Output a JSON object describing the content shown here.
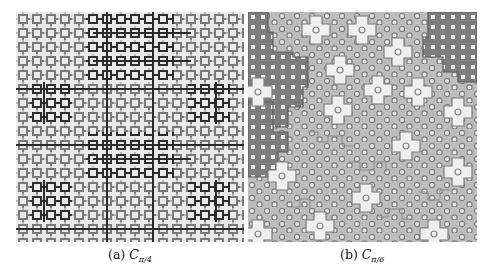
{
  "figure": {
    "panels": [
      {
        "id": "a",
        "label": "(a)",
        "symbol": "C",
        "subscript": "π/4",
        "description": "Square tiling pattern with nested square motifs in light, medium and dark gray"
      },
      {
        "id": "b",
        "label": "(b)",
        "symbol": "C",
        "subscript": "π/6",
        "description": "Aperiodic tiling with circular motifs, white cross-shaped clusters and dark gray regions"
      }
    ],
    "colors": {
      "background": "#ffffff",
      "light_gray": "#c8c8c8",
      "mid_gray": "#8a8a8a",
      "dark_gray": "#3a3a3a",
      "panel_b_fill": "#bdbdbd",
      "panel_b_dark": "#7d7d7d",
      "panel_b_white": "#efefef"
    }
  }
}
